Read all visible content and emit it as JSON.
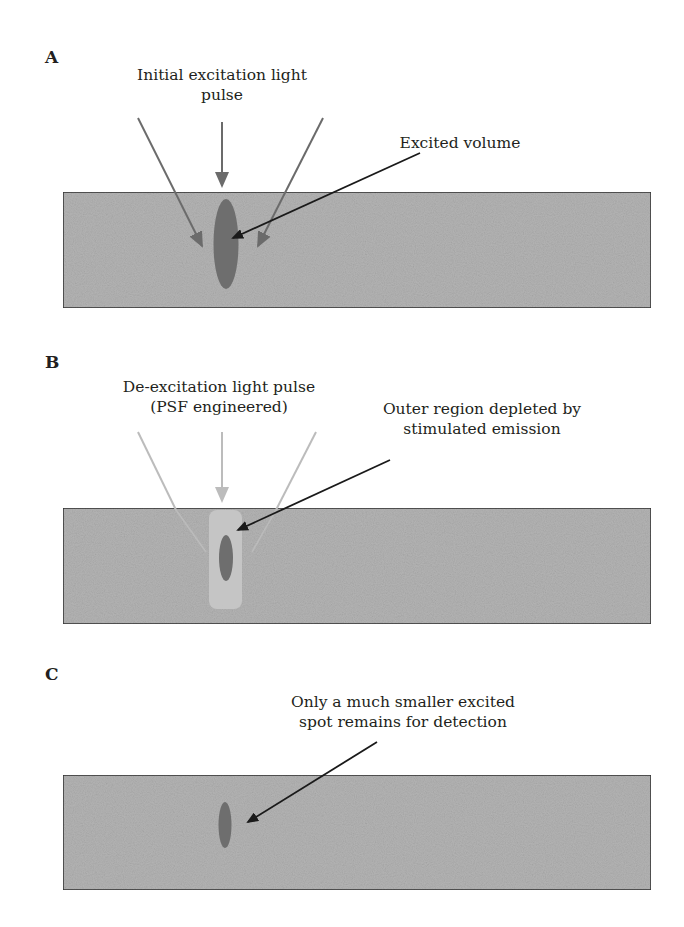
{
  "figure": {
    "panels": [
      {
        "letter": "A",
        "labels": {
          "pulse_line1": "Initial excitation light",
          "pulse_line2": "pulse",
          "pointer_line1": "Excited volume"
        }
      },
      {
        "letter": "B",
        "labels": {
          "pulse_line1": "De-excitation light pulse",
          "pulse_line2": "(PSF engineered)",
          "pointer_line1": "Outer region depleted by",
          "pointer_line2": "stimulated emission"
        }
      },
      {
        "letter": "C",
        "labels": {
          "pointer_line1": "Only a much smaller excited",
          "pointer_line2": "spot remains for detection"
        }
      }
    ],
    "colors": {
      "sample_band": "#b4b4b4",
      "band_border": "#3a3a3a",
      "excited_volume": "#6e6e6e",
      "excitation_arrows": "#6b6b6b",
      "de_excitation_arrows": "#bcbcbc",
      "depletion_region": "#c6c6c6",
      "pointer_arrows": "#1a1a1a"
    }
  }
}
